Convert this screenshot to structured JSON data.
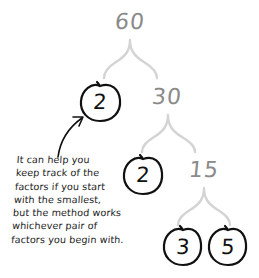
{
  "diagram": {
    "type": "factor-tree",
    "root": {
      "value": "60",
      "circled": false
    },
    "level1": [
      {
        "value": "2",
        "circled": true
      },
      {
        "value": "30",
        "circled": false
      }
    ],
    "level2": [
      {
        "value": "2",
        "circled": true
      },
      {
        "value": "15",
        "circled": false
      }
    ],
    "level3": [
      {
        "value": "3",
        "circled": true
      },
      {
        "value": "5",
        "circled": true
      }
    ],
    "note": {
      "lines": [
        "It can help you",
        "keep track of the",
        "factors if you start",
        "with the smallest,",
        "but the method works",
        "whichever pair of",
        "factors you begin with."
      ]
    },
    "colors": {
      "composite_number": "#8a8a8a",
      "branch": "#d4d4d4",
      "prime_circle": "#111111",
      "arrow": "#111111",
      "note_text": "#222222"
    }
  }
}
